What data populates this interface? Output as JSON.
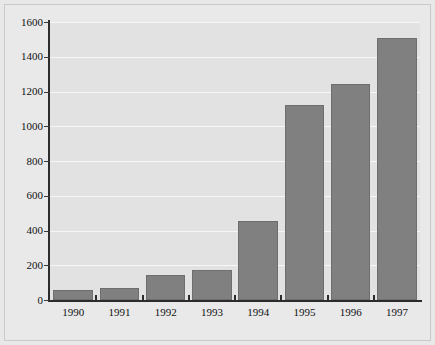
{
  "chart_data": {
    "type": "bar",
    "title": "",
    "subtitle": "",
    "xlabel": "",
    "ylabel": "",
    "categories": [
      "1990",
      "1991",
      "1992",
      "1993",
      "1994",
      "1995",
      "1996",
      "1997"
    ],
    "values": [
      60,
      72,
      145,
      175,
      455,
      1120,
      1245,
      1510
    ],
    "series": [
      {
        "name": "",
        "values": [
          60,
          72,
          145,
          175,
          455,
          1120,
          1245,
          1510
        ]
      }
    ],
    "ylim": [
      0,
      1600
    ],
    "yticks": [
      0,
      200,
      400,
      600,
      800,
      1000,
      1200,
      1400,
      1600
    ],
    "ytick_labels": [
      "0",
      "200",
      "400",
      "600",
      "800",
      "1000",
      "1200",
      "1400",
      "1600"
    ],
    "xtick_labels": [
      "1990",
      "1991",
      "1992",
      "1993",
      "1994",
      "1995",
      "1996",
      "1997"
    ],
    "grid": true,
    "legend": false,
    "legend_position": "none",
    "annotations": []
  },
  "style": {
    "bar_fill": "#808080",
    "bar_edge": "#6e6e6e",
    "plot_background": "#e2e2e2",
    "figure_background": "#e9e9e9",
    "gridline_color": "#f6f6f6",
    "axis_color": "#2c2c2c",
    "text_color": "#111111"
  }
}
